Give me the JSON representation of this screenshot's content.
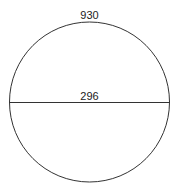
{
  "diagram": {
    "shape": "circle",
    "circumference_label": "930",
    "diameter_label": "296",
    "stroke_color": "#333333",
    "background": "#ffffff"
  }
}
